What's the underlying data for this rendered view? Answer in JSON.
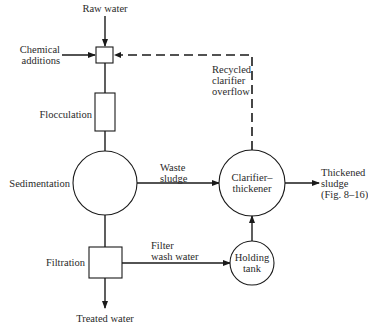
{
  "diagram": {
    "type": "process-flow",
    "nodes": [
      {
        "id": "mixer",
        "shape": "small-square",
        "label": ""
      },
      {
        "id": "flocculation",
        "shape": "rectangle",
        "label": "Flocculation"
      },
      {
        "id": "sedimentation",
        "shape": "circle",
        "label": "Sedimentation"
      },
      {
        "id": "filtration",
        "shape": "square",
        "label": "Filtration"
      },
      {
        "id": "clarifier",
        "shape": "circle",
        "label_lines": [
          "Clarifier–",
          "thickener"
        ]
      },
      {
        "id": "holding",
        "shape": "circle",
        "label_lines": [
          "Holding",
          "tank"
        ]
      }
    ],
    "inputs": {
      "raw_water": "Raw water",
      "chemical_lines": [
        "Chemical",
        "additions"
      ]
    },
    "outputs": {
      "treated_water": "Treated water",
      "thickened_lines": [
        "Thickened",
        "sludge",
        "(Fig. 8–16)"
      ]
    },
    "flows": {
      "waste_sludge_lines": [
        "Waste",
        "sludge"
      ],
      "filter_wash_lines": [
        "Filter",
        "wash water"
      ],
      "recycled_lines": [
        "Recycled",
        "clarifier",
        "overflow"
      ]
    },
    "edges": [
      {
        "from": "raw_water",
        "to": "mixer",
        "style": "solid"
      },
      {
        "from": "chemical_additions",
        "to": "mixer",
        "style": "solid"
      },
      {
        "from": "mixer",
        "to": "flocculation",
        "style": "solid"
      },
      {
        "from": "flocculation",
        "to": "sedimentation",
        "style": "solid"
      },
      {
        "from": "sedimentation",
        "to": "filtration",
        "style": "solid"
      },
      {
        "from": "filtration",
        "to": "treated_water",
        "style": "solid"
      },
      {
        "from": "sedimentation",
        "to": "clarifier",
        "label": "Waste sludge",
        "style": "solid"
      },
      {
        "from": "filtration",
        "to": "holding",
        "label": "Filter wash water",
        "style": "solid"
      },
      {
        "from": "holding",
        "to": "clarifier",
        "style": "solid"
      },
      {
        "from": "clarifier",
        "to": "thickened_sludge",
        "style": "solid"
      },
      {
        "from": "clarifier",
        "to": "mixer",
        "label": "Recycled clarifier overflow",
        "style": "dashed"
      }
    ]
  },
  "colors": {
    "line": "#1a1a1a",
    "background": "#ffffff"
  }
}
